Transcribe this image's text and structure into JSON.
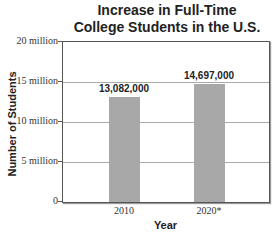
{
  "chart_data": {
    "type": "bar",
    "title": "Increase in Full-Time College Students in the U.S.",
    "title_lines": [
      "Increase in Full-Time",
      "College Students in the U.S."
    ],
    "xlabel": "Year",
    "ylabel": "Number of Students",
    "categories": [
      "2010",
      "2020*"
    ],
    "values": [
      13082000,
      14697000
    ],
    "value_labels": [
      "13,082,000",
      "14,697,000"
    ],
    "ylim": [
      0,
      20000000
    ],
    "yticks": [
      0,
      5000000,
      10000000,
      15000000,
      20000000
    ],
    "ytick_labels": [
      "0",
      "5 million",
      "10 million",
      "15 million",
      "20 million"
    ],
    "grid": true,
    "bar_color": "#a8a8a8",
    "legend": null
  }
}
